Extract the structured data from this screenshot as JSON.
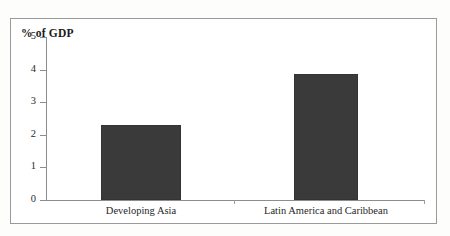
{
  "chart_data": {
    "type": "bar",
    "title": "% of GDP",
    "xlabel": "",
    "ylabel": "% of GDP",
    "categories": [
      "Developing Asia",
      "Latin America and Caribbean"
    ],
    "values": [
      2.3,
      3.85
    ],
    "ylim": [
      0,
      5
    ],
    "yticks": [
      0,
      1,
      2,
      3,
      4,
      5
    ],
    "ytick_labels": [
      "0",
      "1",
      "2",
      "3",
      "4",
      "5"
    ],
    "grid": false,
    "legend": null,
    "bar_color": "#3a3a3a",
    "axis_color": "#8d8d8d",
    "frame_color": "#9a9a9a"
  },
  "axis": {
    "title": "% of GDP"
  }
}
